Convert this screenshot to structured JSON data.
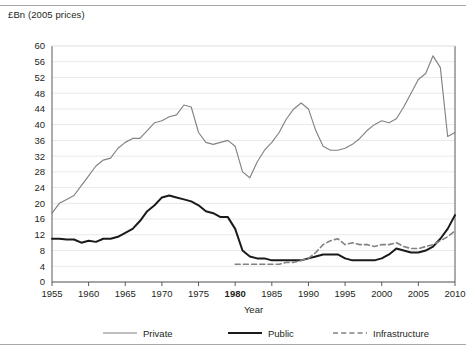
{
  "header": {
    "unit_label": "£Bn (2005 prices)"
  },
  "chart_data": {
    "type": "line",
    "title": "",
    "subtitle": "",
    "unit_note": "£Bn (2005 prices)",
    "xlabel": "Year",
    "ylabel": "",
    "xlim": [
      1955,
      2010
    ],
    "ylim": [
      0,
      60
    ],
    "ytick_step": 4,
    "xtick_step": 5,
    "grid": true,
    "grid_axis": "y",
    "legend_position": "bottom",
    "highlighted_xtick": "1980",
    "ytick_labels": [
      "0",
      "4",
      "8",
      "12",
      "16",
      "20",
      "24",
      "28",
      "32",
      "36",
      "40",
      "44",
      "48",
      "52",
      "56",
      "60"
    ],
    "xtick_labels": [
      "1955",
      "1960",
      "1965",
      "1970",
      "1975",
      "1980",
      "1985",
      "1990",
      "1995",
      "2000",
      "2005",
      "2010"
    ],
    "x": [
      1955,
      1956,
      1957,
      1958,
      1959,
      1960,
      1961,
      1962,
      1963,
      1964,
      1965,
      1966,
      1967,
      1968,
      1969,
      1970,
      1971,
      1972,
      1973,
      1974,
      1975,
      1976,
      1977,
      1978,
      1979,
      1980,
      1981,
      1982,
      1983,
      1984,
      1985,
      1986,
      1987,
      1988,
      1989,
      1990,
      1991,
      1992,
      1993,
      1994,
      1995,
      1996,
      1997,
      1998,
      1999,
      2000,
      2001,
      2002,
      2003,
      2004,
      2005,
      2006,
      2007,
      2008,
      2009,
      2010
    ],
    "series": [
      {
        "name": "Private",
        "style": "solid-thin-grey",
        "color": "#808285",
        "values": [
          17.5,
          20.0,
          21.0,
          22.0,
          24.5,
          27.0,
          29.5,
          31.0,
          31.5,
          34.0,
          35.5,
          36.5,
          36.5,
          38.5,
          40.5,
          41.0,
          42.0,
          42.5,
          45.0,
          44.5,
          38.0,
          35.5,
          35.0,
          35.5,
          36.0,
          34.5,
          28.0,
          26.5,
          30.5,
          33.5,
          35.5,
          38.0,
          41.5,
          44.0,
          45.5,
          44.0,
          38.5,
          34.5,
          33.5,
          33.5,
          34.0,
          35.0,
          36.5,
          38.5,
          40.0,
          41.0,
          40.5,
          41.5,
          44.5,
          48.0,
          51.5,
          53.0,
          57.5,
          54.5,
          37.0,
          38.0
        ]
      },
      {
        "name": "Public",
        "style": "solid-thick-black",
        "color": "#1a1a1a",
        "values": [
          11.0,
          11.0,
          10.8,
          10.8,
          10.0,
          10.5,
          10.2,
          11.0,
          11.0,
          11.5,
          12.5,
          13.5,
          15.5,
          18.0,
          19.5,
          21.5,
          22.0,
          21.5,
          21.0,
          20.5,
          19.5,
          18.0,
          17.5,
          16.5,
          16.5,
          13.5,
          8.0,
          6.5,
          6.0,
          6.0,
          5.5,
          5.5,
          5.5,
          5.5,
          5.5,
          6.0,
          6.5,
          7.0,
          7.0,
          7.0,
          6.0,
          5.5,
          5.5,
          5.5,
          5.5,
          6.0,
          7.0,
          8.5,
          8.0,
          7.5,
          7.5,
          8.0,
          9.0,
          11.0,
          13.5,
          17.0
        ]
      },
      {
        "name": "Infrastructure",
        "style": "dashed-grey",
        "color": "#808285",
        "values": [
          null,
          null,
          null,
          null,
          null,
          null,
          null,
          null,
          null,
          null,
          null,
          null,
          null,
          null,
          null,
          null,
          null,
          null,
          null,
          null,
          null,
          null,
          null,
          null,
          null,
          4.5,
          4.5,
          4.5,
          4.5,
          4.5,
          4.5,
          4.5,
          5.0,
          5.0,
          5.5,
          6.0,
          7.5,
          9.5,
          10.5,
          11.0,
          9.5,
          10.0,
          9.5,
          9.5,
          9.0,
          9.5,
          9.5,
          10.0,
          9.0,
          8.5,
          8.5,
          9.0,
          9.5,
          10.5,
          11.5,
          13.0
        ]
      }
    ]
  },
  "legend": {
    "items": [
      {
        "label": "Private",
        "key": "private"
      },
      {
        "label": "Public",
        "key": "public"
      },
      {
        "label": "Infrastructure",
        "key": "infrastructure"
      }
    ]
  },
  "colors": {
    "private": "#808285",
    "public": "#1a1a1a",
    "infrastructure": "#808285",
    "grid": "#e9e9e9",
    "axis": "#58595b",
    "rule": "#a8a8a8"
  }
}
